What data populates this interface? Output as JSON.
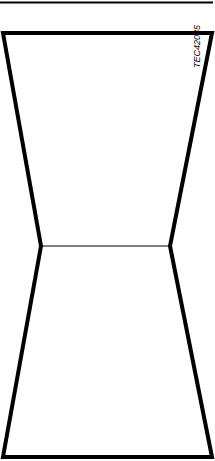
{
  "figure": {
    "label": "TEC42035",
    "stroke_color": "#000000",
    "background": "#ffffff",
    "shape": {
      "top_left": [
        2,
        33
      ],
      "top_right": [
        212,
        33
      ],
      "mid_left": [
        41,
        246
      ],
      "mid_right": [
        170,
        246
      ],
      "bottom_left": [
        3,
        457
      ],
      "bottom_right": [
        212,
        457
      ]
    }
  }
}
